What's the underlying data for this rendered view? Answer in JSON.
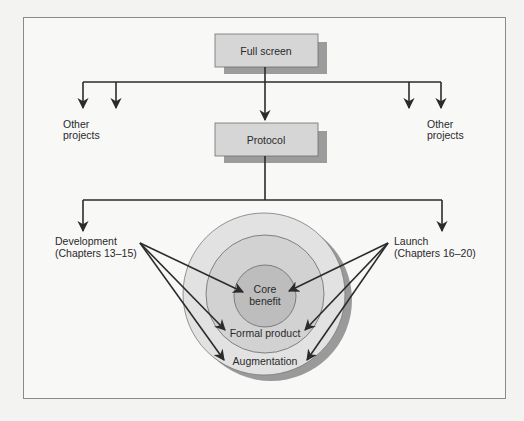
{
  "diagram": {
    "boxes": {
      "full_screen": "Full screen",
      "protocol": "Protocol"
    },
    "side_labels": {
      "other_projects_left_line1": "Other",
      "other_projects_left_line2": "projects",
      "other_projects_right_line1": "Other",
      "other_projects_right_line2": "projects",
      "development_line1": "Development",
      "development_line2": "(Chapters 13–15)",
      "launch_line1": "Launch",
      "launch_line2": "(Chapters 16–20)"
    },
    "rings": {
      "core_line1": "Core",
      "core_line2": "benefit",
      "formal": "Formal product",
      "augmentation": "Augmentation"
    },
    "colors": {
      "box_fill": "#d6d6d6",
      "box_shadow": "#9c9c9c",
      "ring_outer": "#e2e2e2",
      "ring_middle": "#d2d2d2",
      "ring_core": "#bdbdbd",
      "ring_shadow": "#9a9a9a",
      "line": "#2b2b2b"
    }
  }
}
